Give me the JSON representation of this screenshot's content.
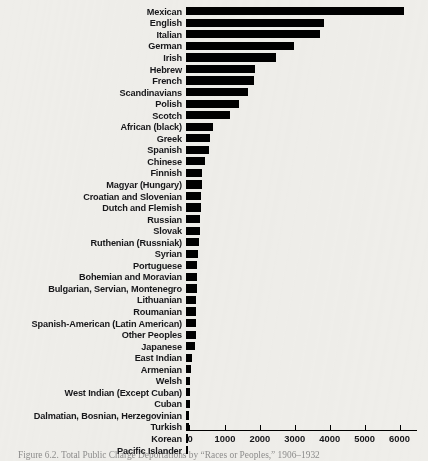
{
  "chart_data": {
    "type": "bar",
    "orientation": "horizontal",
    "title": "",
    "xlabel": "",
    "ylabel": "",
    "xlim": [
      0,
      6500
    ],
    "grid": false,
    "legend": null,
    "xticks": [
      0,
      1000,
      2000,
      3000,
      4000,
      5000,
      6000
    ],
    "xticklabels": [
      "0",
      "1000",
      "2000",
      "3000",
      "4000",
      "5000",
      "6000"
    ],
    "categories": [
      "Mexican",
      "English",
      "Italian",
      "German",
      "Irish",
      "Hebrew",
      "French",
      "Scandinavians",
      "Polish",
      "Scotch",
      "African (black)",
      "Greek",
      "Spanish",
      "Chinese",
      "Finnish",
      "Magyar (Hungary)",
      "Croatian and Slovenian",
      "Dutch and Flemish",
      "Russian",
      "Slovak",
      "Ruthenian (Russniak)",
      "Syrian",
      "Portuguese",
      "Bohemian and Moravian",
      "Bulgarian, Servian, Montenegro",
      "Lithuanian",
      "Roumanian",
      "Spanish-American (Latin American)",
      "Other Peoples",
      "Japanese",
      "East Indian",
      "Armenian",
      "Welsh",
      "West Indian (Except Cuban)",
      "Cuban",
      "Dalmatian, Bosnian, Herzegovinian",
      "Turkish",
      "Korean",
      "Pacific Islander"
    ],
    "values": [
      6230,
      3940,
      3830,
      3090,
      2570,
      1990,
      1960,
      1780,
      1510,
      1260,
      780,
      690,
      660,
      540,
      460,
      450,
      430,
      420,
      400,
      390,
      380,
      330,
      320,
      310,
      305,
      300,
      295,
      290,
      285,
      270,
      160,
      150,
      115,
      110,
      105,
      100,
      95,
      55,
      50
    ],
    "bar_color": "#000000",
    "background_color": "#efeeea"
  },
  "caption": {
    "text": "Figure 6.2. Total Public Charge Deportations by “Races or Peoples,” 1906–1932"
  }
}
